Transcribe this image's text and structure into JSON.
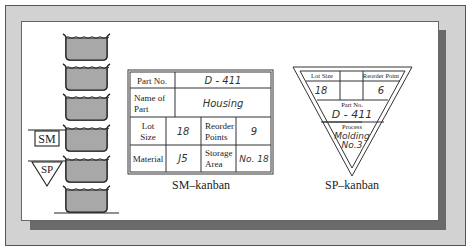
{
  "figure": {
    "bins": {
      "count": 6,
      "fill_color": "#a8a8a8",
      "outline_color": "#222222"
    },
    "markers": {
      "sm_label": "SM",
      "sp_label": "SP"
    },
    "sm_kanban": {
      "caption": "SM–kanban",
      "rows": [
        {
          "label": "Part No.",
          "value": "D - 411"
        },
        {
          "label": "Name of Part",
          "value": "Housing"
        },
        {
          "label": "Lot Size",
          "value": "18",
          "label2": "Reorder Points",
          "value2": "9"
        },
        {
          "label": "Material",
          "value": "J5",
          "label2": "Storage Area",
          "value2": "No. 18"
        }
      ],
      "labels": {
        "part_no": "Part No.",
        "name_of": "Name of",
        "part": "Part",
        "lot": "Lot",
        "size": "Size",
        "reorder": "Reorder",
        "points": "Points",
        "material": "Material",
        "storage": "Storage",
        "area": "Area"
      },
      "values": {
        "part_no": "D - 411",
        "name": "Housing",
        "lot_size": "18",
        "reorder_points": "9",
        "material": "J5",
        "storage_area": "No. 18"
      }
    },
    "sp_kanban": {
      "caption": "SP–kanban",
      "labels": {
        "lot_size": "Lot Size",
        "reorder_point": "Reorder Point",
        "part_no": "Part No.",
        "process": "Process"
      },
      "values": {
        "lot_size": "18",
        "reorder_point": "6",
        "part_no": "D - 411",
        "process_line1": "Molding",
        "process_line2": "No.3"
      }
    }
  }
}
